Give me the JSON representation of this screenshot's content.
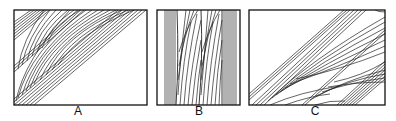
{
  "figure": {
    "panels": [
      {
        "id": "A",
        "label": "A",
        "description": "Cross-bedding sets with tangential foresets, bands rising from lower-left to upper-right"
      },
      {
        "id": "B",
        "label": "B",
        "description": "Steep near-vertical laminae with curved foresets between vertical bands"
      },
      {
        "id": "C",
        "label": "C",
        "description": "Cross-bedding sets with concave-up foresets, bands rising from lower-left to upper-right"
      }
    ]
  }
}
